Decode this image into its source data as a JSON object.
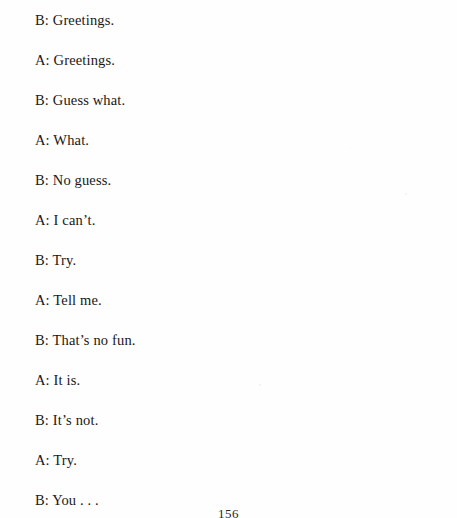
{
  "page": {
    "folio": "156",
    "text_color": "#1a1715",
    "background_color": "#fefefe"
  },
  "dialogue": {
    "lines": [
      {
        "text": "B: Greetings."
      },
      {
        "text": "A: Greetings."
      },
      {
        "text": "B: Guess what."
      },
      {
        "text": "A: What."
      },
      {
        "text": "B: No guess."
      },
      {
        "text": "A: I can’t."
      },
      {
        "text": "B: Try."
      },
      {
        "text": "A: Tell me."
      },
      {
        "text": "B: That’s no fun."
      },
      {
        "text": "A: It is."
      },
      {
        "text": "B: It’s not."
      },
      {
        "text": "A: Try."
      },
      {
        "text": "B: You . . ."
      }
    ]
  }
}
